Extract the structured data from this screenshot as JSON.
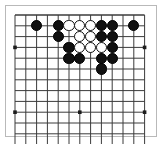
{
  "figure": {
    "kind": "go-board-diagram",
    "frame_color": "#b9b9b9",
    "background_color": "#ffffff"
  },
  "board": {
    "columns": 13,
    "rows": 13,
    "origin_x": 15,
    "origin_y": 15,
    "spacing": 10.8,
    "line_color": "#3b3b3b",
    "line_width": 1,
    "edge_line_width": 1.6,
    "star_point_color": "#1c1c1c",
    "star_point_radius": 1.8,
    "star_points": [
      {
        "col": 0,
        "row": 3
      },
      {
        "col": 6,
        "row": 3
      },
      {
        "col": 12,
        "row": 3
      },
      {
        "col": 0,
        "row": 9
      },
      {
        "col": 6,
        "row": 9
      },
      {
        "col": 12,
        "row": 9
      }
    ]
  },
  "stones": {
    "radius": 5.6,
    "black_color": "#111111",
    "white_color": "#ffffff",
    "white_outline_color": "#111111",
    "black_count": 18,
    "white_count": 7,
    "items": [
      {
        "color": "black",
        "col": 2,
        "row": 1,
        "label": "black-stone"
      },
      {
        "color": "black",
        "col": 4,
        "row": 1,
        "label": "black-stone"
      },
      {
        "color": "white",
        "col": 5,
        "row": 1,
        "label": "white-stone"
      },
      {
        "color": "white",
        "col": 6,
        "row": 1,
        "label": "white-stone"
      },
      {
        "color": "white",
        "col": 7,
        "row": 1,
        "label": "white-stone"
      },
      {
        "color": "black",
        "col": 8,
        "row": 1,
        "label": "black-stone"
      },
      {
        "color": "black",
        "col": 9,
        "row": 1,
        "label": "black-stone"
      },
      {
        "color": "black",
        "col": 11,
        "row": 1,
        "label": "black-stone"
      },
      {
        "color": "black",
        "col": 4,
        "row": 2,
        "label": "black-stone"
      },
      {
        "color": "white",
        "col": 6,
        "row": 2,
        "label": "white-stone"
      },
      {
        "color": "white",
        "col": 7,
        "row": 2,
        "label": "white-stone"
      },
      {
        "color": "black",
        "col": 8,
        "row": 2,
        "label": "black-stone"
      },
      {
        "color": "black",
        "col": 9,
        "row": 2,
        "label": "black-stone"
      },
      {
        "color": "black",
        "col": 5,
        "row": 3,
        "label": "black-stone"
      },
      {
        "color": "white",
        "col": 6,
        "row": 3,
        "label": "white-stone"
      },
      {
        "color": "white",
        "col": 7,
        "row": 3,
        "label": "white-stone"
      },
      {
        "color": "white",
        "col": 8,
        "row": 3,
        "label": "white-stone"
      },
      {
        "color": "black",
        "col": 9,
        "row": 3,
        "label": "black-stone"
      },
      {
        "color": "black",
        "col": 5,
        "row": 4,
        "label": "black-stone"
      },
      {
        "color": "black",
        "col": 6,
        "row": 4,
        "label": "black-stone"
      },
      {
        "color": "black",
        "col": 8,
        "row": 4,
        "label": "black-stone"
      },
      {
        "color": "black",
        "col": 9,
        "row": 4,
        "label": "black-stone"
      },
      {
        "color": "black",
        "col": 8,
        "row": 5,
        "label": "black-stone"
      }
    ]
  }
}
